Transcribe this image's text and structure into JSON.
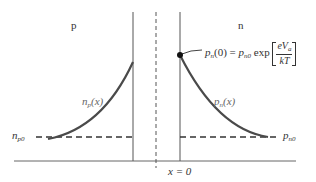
{
  "diagram": {
    "regions": {
      "p_label": "p",
      "n_label": "n"
    },
    "curves": {
      "left": {
        "name": "n",
        "sub": "p",
        "arg": "(x)"
      },
      "right": {
        "name": "p",
        "sub": "n",
        "arg": "(x)"
      }
    },
    "levels": {
      "left": {
        "name": "n",
        "sub": "p0"
      },
      "right": {
        "name": "p",
        "sub": "n0"
      }
    },
    "equation": {
      "lhs_name": "p",
      "lhs_sub": "n",
      "lhs_arg": "(0) = ",
      "rhs_name": "p",
      "rhs_sub": "n0",
      "func": " exp ",
      "numerator_e": "eV",
      "numerator_sub": "a",
      "denominator": "kT"
    },
    "axis": {
      "origin_label": "x = 0"
    },
    "colors": {
      "curve": "#4a4a4a",
      "lines": "#555555",
      "dot": "#111111"
    }
  }
}
